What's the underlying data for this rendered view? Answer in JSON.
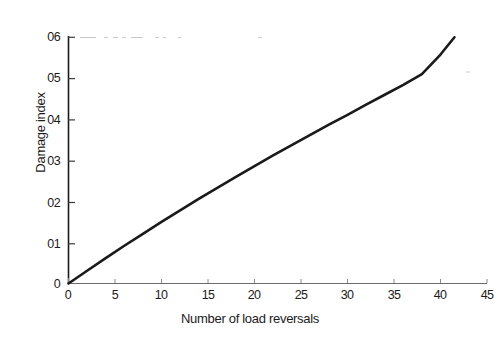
{
  "chart_data": {
    "type": "line",
    "title": "",
    "xlabel": "Number of load reversals",
    "ylabel": "Damage index",
    "xlim": [
      0,
      45
    ],
    "ylim": [
      0,
      0.6
    ],
    "grid": false,
    "legend": null,
    "xticks": [
      0,
      5,
      10,
      15,
      20,
      25,
      30,
      35,
      40,
      45
    ],
    "xtick_labels": [
      "0",
      "5",
      "10",
      "15",
      "20",
      "25",
      "30",
      "35",
      "40",
      "45"
    ],
    "yticks": [
      0,
      0.1,
      0.2,
      0.3,
      0.4,
      0.5,
      0.6
    ],
    "ytick_labels": [
      "0",
      "01",
      "02",
      "03",
      "04",
      "05",
      "06"
    ],
    "series": [
      {
        "name": "Damage index",
        "color": "#1a1a1a",
        "x": [
          0,
          2,
          4,
          6,
          8,
          10,
          12,
          14,
          16,
          18,
          20,
          22,
          24,
          26,
          28,
          30,
          32,
          34,
          36,
          38,
          40,
          41.5
        ],
        "y": [
          0.0,
          0.031,
          0.062,
          0.092,
          0.121,
          0.15,
          0.178,
          0.206,
          0.233,
          0.26,
          0.286,
          0.312,
          0.337,
          0.362,
          0.387,
          0.411,
          0.436,
          0.46,
          0.484,
          0.51,
          0.558,
          0.6
        ]
      }
    ]
  },
  "axes": {
    "y_axis_name": "y-axis-line",
    "x_axis_name": "x-axis-line"
  }
}
